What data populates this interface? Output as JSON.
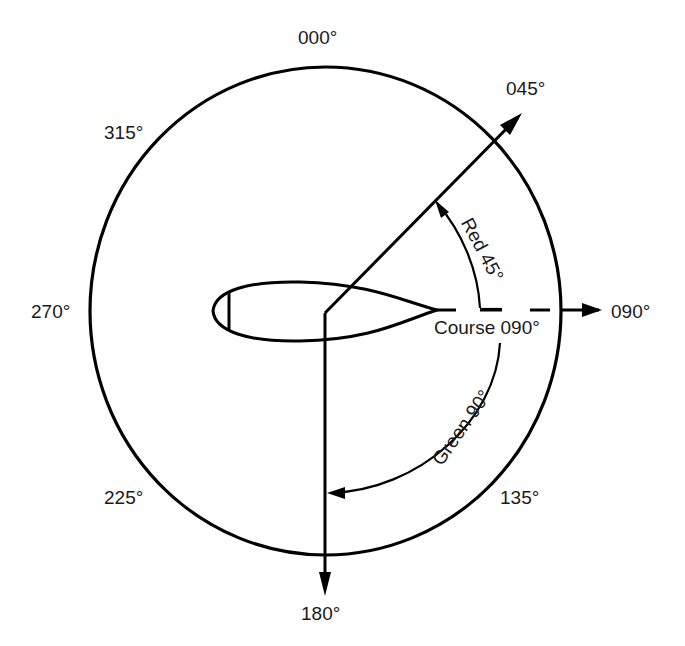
{
  "diagram": {
    "type": "relative-bearing-compass",
    "compass_labels": {
      "n": "000°",
      "ne": "045°",
      "e": "090°",
      "se": "135°",
      "s": "180°",
      "sw": "225°",
      "w": "270°",
      "nw": "315°"
    },
    "course_label": "Course 090°",
    "red_arc_label": "Red 45°",
    "green_arc_label": "Green 90°",
    "colors": {
      "stroke": "#000000",
      "text": "#1a1a1a",
      "background": "#ffffff"
    }
  }
}
